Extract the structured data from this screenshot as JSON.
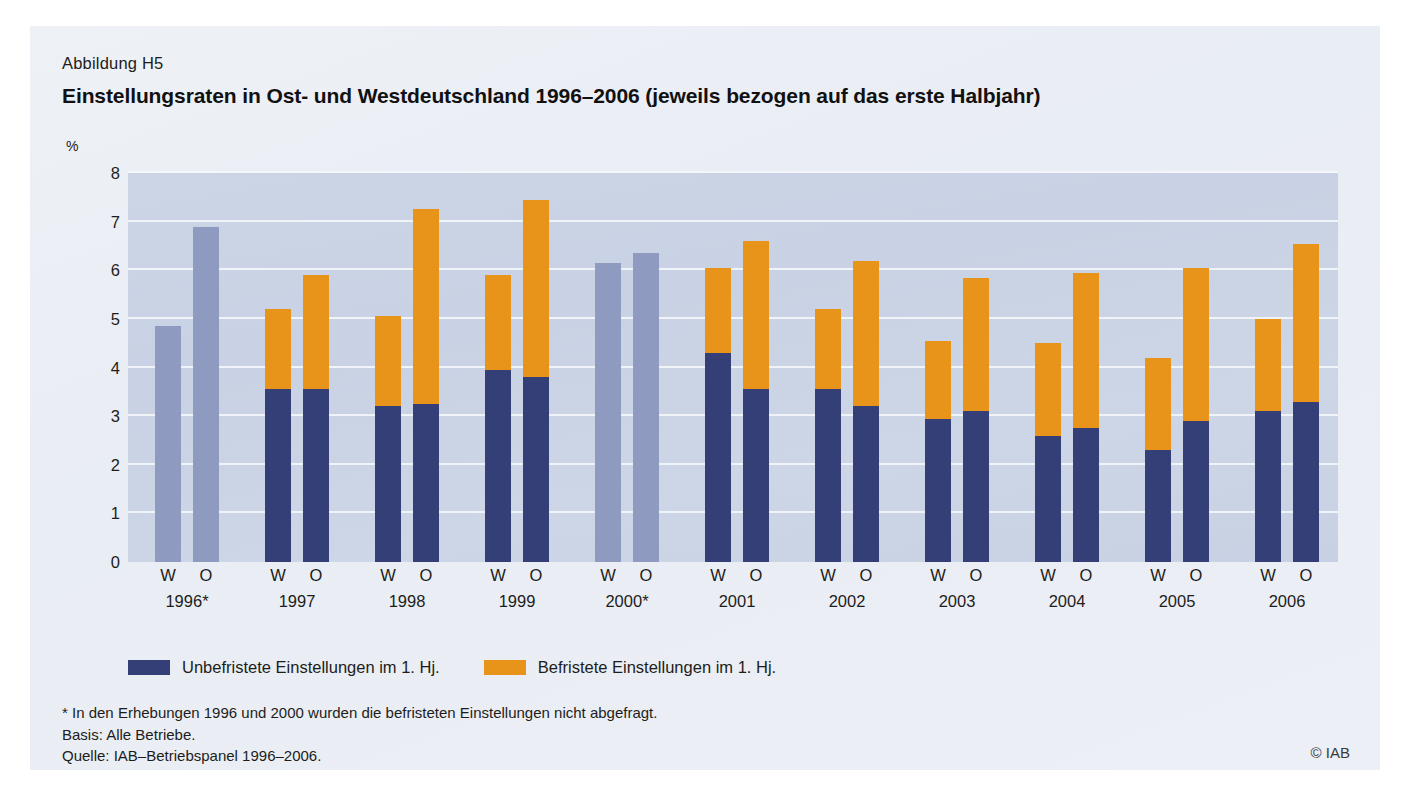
{
  "figure": {
    "label": "Abbildung H5",
    "title": "Einstellungsraten in Ost- und Westdeutschland 1996–2006 (jeweils bezogen auf das erste Halbjahr)",
    "unit": "%",
    "copyright": "© IAB"
  },
  "legend": {
    "items": [
      {
        "label": "Unbefristete Einstellungen im 1. Hj.",
        "color": "#343f78",
        "name": "legend-unbefristete"
      },
      {
        "label": "Befristete Einstellungen im 1. Hj.",
        "color": "#e8941b",
        "name": "legend-befristete"
      }
    ]
  },
  "notes": [
    "* In den Erhebungen 1996 und 2000 wurden die befristeten Einstellungen nicht abgefragt.",
    "Basis: Alle Betriebe.",
    "Quelle: IAB–Betriebspanel 1996–2006."
  ],
  "chart_data": {
    "type": "bar",
    "stacked": true,
    "title": "Einstellungsraten in Ost- und Westdeutschland 1996–2006 (jeweils bezogen auf das erste Halbjahr)",
    "xlabel": "",
    "ylabel": "%",
    "ylim": [
      0,
      8
    ],
    "yticks": [
      0,
      1,
      2,
      3,
      4,
      5,
      6,
      7,
      8
    ],
    "grid": true,
    "legend_position": "below-plot",
    "region_labels": {
      "W": "W",
      "O": "O"
    },
    "categories": [
      "1996*",
      "1997",
      "1998",
      "1999",
      "2000*",
      "2001",
      "2002",
      "2003",
      "2004",
      "2005",
      "2006"
    ],
    "series": [
      {
        "name": "Unbefristete Einstellungen im 1. Hj.",
        "color": "#343f78"
      },
      {
        "name": "Befristete Einstellungen im 1. Hj.",
        "color": "#e8941b"
      },
      {
        "name": "Einstellungen gesamt (ohne Aufteilung)",
        "color": "#8e9abf"
      }
    ],
    "groups": [
      {
        "year": "1996*",
        "bars": [
          {
            "region": "W",
            "split": false,
            "total": 4.85,
            "unbefristet": null,
            "befristet": null
          },
          {
            "region": "O",
            "split": false,
            "total": 6.9,
            "unbefristet": null,
            "befristet": null
          }
        ]
      },
      {
        "year": "1997",
        "bars": [
          {
            "region": "W",
            "split": true,
            "total": 5.2,
            "unbefristet": 3.55,
            "befristet": 1.65
          },
          {
            "region": "O",
            "split": true,
            "total": 5.9,
            "unbefristet": 3.55,
            "befristet": 2.35
          }
        ]
      },
      {
        "year": "1998",
        "bars": [
          {
            "region": "W",
            "split": true,
            "total": 5.05,
            "unbefristet": 3.2,
            "befristet": 1.85
          },
          {
            "region": "O",
            "split": true,
            "total": 7.25,
            "unbefristet": 3.25,
            "befristet": 4.0
          }
        ]
      },
      {
        "year": "1999",
        "bars": [
          {
            "region": "W",
            "split": true,
            "total": 5.9,
            "unbefristet": 3.95,
            "befristet": 1.95
          },
          {
            "region": "O",
            "split": true,
            "total": 7.45,
            "unbefristet": 3.8,
            "befristet": 3.65
          }
        ]
      },
      {
        "year": "2000*",
        "bars": [
          {
            "region": "W",
            "split": false,
            "total": 6.15,
            "unbefristet": null,
            "befristet": null
          },
          {
            "region": "O",
            "split": false,
            "total": 6.35,
            "unbefristet": null,
            "befristet": null
          }
        ]
      },
      {
        "year": "2001",
        "bars": [
          {
            "region": "W",
            "split": true,
            "total": 6.05,
            "unbefristet": 4.3,
            "befristet": 1.75
          },
          {
            "region": "O",
            "split": true,
            "total": 6.6,
            "unbefristet": 3.55,
            "befristet": 3.05
          }
        ]
      },
      {
        "year": "2002",
        "bars": [
          {
            "region": "W",
            "split": true,
            "total": 5.2,
            "unbefristet": 3.55,
            "befristet": 1.65
          },
          {
            "region": "O",
            "split": true,
            "total": 6.2,
            "unbefristet": 3.2,
            "befristet": 3.0
          }
        ]
      },
      {
        "year": "2003",
        "bars": [
          {
            "region": "W",
            "split": true,
            "total": 4.55,
            "unbefristet": 2.95,
            "befristet": 1.6
          },
          {
            "region": "O",
            "split": true,
            "total": 5.85,
            "unbefristet": 3.1,
            "befristet": 2.75
          }
        ]
      },
      {
        "year": "2004",
        "bars": [
          {
            "region": "W",
            "split": true,
            "total": 4.5,
            "unbefristet": 2.6,
            "befristet": 1.9
          },
          {
            "region": "O",
            "split": true,
            "total": 5.95,
            "unbefristet": 2.75,
            "befristet": 3.2
          }
        ]
      },
      {
        "year": "2005",
        "bars": [
          {
            "region": "W",
            "split": true,
            "total": 4.2,
            "unbefristet": 2.3,
            "befristet": 1.9
          },
          {
            "region": "O",
            "split": true,
            "total": 6.05,
            "unbefristet": 2.9,
            "befristet": 3.15
          }
        ]
      },
      {
        "year": "2006",
        "bars": [
          {
            "region": "W",
            "split": true,
            "total": 5.0,
            "unbefristet": 3.1,
            "befristet": 1.9
          },
          {
            "region": "O",
            "split": true,
            "total": 6.55,
            "unbefristet": 3.3,
            "befristet": 3.25
          }
        ]
      }
    ]
  }
}
